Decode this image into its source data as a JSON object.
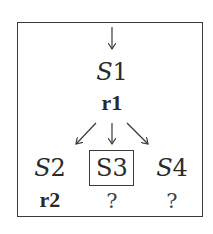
{
  "diagram": {
    "root": {
      "state": "S",
      "state_num": "1",
      "rule": "r1"
    },
    "children": [
      {
        "state": "S",
        "state_num": "2",
        "rule": "r2",
        "boxed": false,
        "italic": true
      },
      {
        "state": "S3",
        "rule": "?",
        "boxed": true,
        "italic": false
      },
      {
        "state": "S",
        "state_num": "4",
        "rule": "?",
        "boxed": false,
        "italic": true
      }
    ],
    "colors": {
      "line": "#3a3a3a",
      "text": "#2a2a2a"
    }
  }
}
